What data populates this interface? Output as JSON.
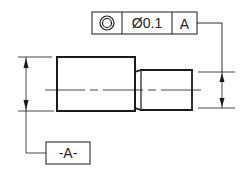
{
  "drawing": {
    "feature_control_frame": {
      "symbol": "concentricity",
      "tolerance": "Ø0.1",
      "datum_ref": "A"
    },
    "datum_label": "-A-",
    "colors": {
      "line": "#1a1a1a",
      "background": "#ffffff"
    }
  }
}
